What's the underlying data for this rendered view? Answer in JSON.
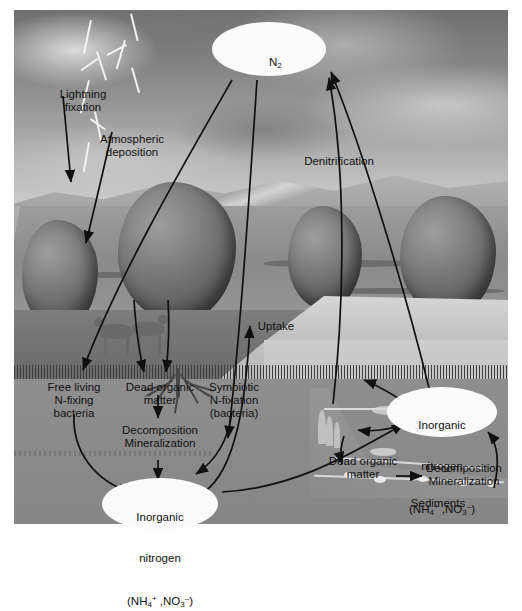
{
  "figure": {
    "type": "diagram",
    "background_style": "grayscale landscape photograph with storm clouds, mountains, trees, river and lake"
  },
  "pools": {
    "atmosphere": {
      "label": "N2",
      "formula_base": "N",
      "formula_sub": "2"
    },
    "terrestrial_inorganic": {
      "line1": "Inorganic",
      "line2": "nitrogen",
      "formula_open": "(NH",
      "formula_sub1": "4",
      "formula_sup1": "+",
      "formula_mid": " ,NO",
      "formula_sub2": "3",
      "formula_sup2": "–",
      "formula_close": ")"
    },
    "aquatic_inorganic": {
      "line1": "Inorganic",
      "line2": "nitrogen",
      "formula_open": "(NH",
      "formula_sub1": "4",
      "formula_sup1": "+",
      "formula_mid": " ,NO",
      "formula_sub2": "3",
      "formula_sup2": "–",
      "formula_close": ")"
    }
  },
  "process_labels": {
    "lightning_fixation": "Lightning\nfixation",
    "atmospheric_deposition": "Atmospheric\ndeposition",
    "denitrification": "Denitrification",
    "uptake": "Uptake",
    "free_living": "Free living\nN-fixing\nbacteria",
    "dead_organic_matter_land": "Dead organic\nmatter",
    "symbiotic": "Symbiotic\nN-fixation\n(bacteria)",
    "decomposition_land": "Decomposition\nMineralization",
    "dead_organic_matter_water": "Dead organic\nmatter",
    "decomposition_water": "Decomposition\nMineralization",
    "sediments": "Sediments"
  },
  "colors": {
    "arrow": "#101010",
    "ellipse_fill": "#fbfbfb",
    "label_text": "#121212",
    "frame_background": "#ffffff"
  }
}
